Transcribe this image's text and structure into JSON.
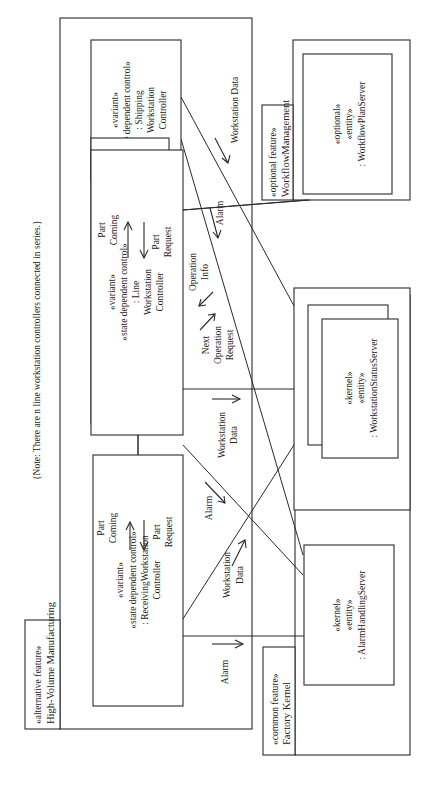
{
  "diagram": {
    "note": "{Note: There are n line workstation controllers connected in series.}",
    "packages": {
      "high_volume": {
        "stereotype": "«alternative feature»",
        "name": "High-Volume Manufacturing"
      },
      "factory_kernel": {
        "stereotype": "«common feature»",
        "name": "Factory Kernel"
      },
      "workflow_mgmt": {
        "stereotype": "«optional feature»",
        "name": "WorkflowManagement"
      }
    },
    "objects": {
      "shipping": {
        "l1": "«variant»",
        "l2": "«state dependent control»",
        "l3": ": Shipping",
        "l4": "Workstation",
        "l5": "Controller"
      },
      "line": {
        "l1": "«variant»",
        "l2": "«state dependent control»",
        "l3": ": Line",
        "l4": "Workstation",
        "l5": "Controller"
      },
      "receiving": {
        "l1": "«variant»",
        "l2": "«state dependent control»",
        "l3": ": ReceivingWorkstation",
        "l4": "Controller"
      },
      "workflow_plan_server": {
        "l1": "«optional»",
        "l2": "«entity»",
        "l3": ": WorkflowPlanServer"
      },
      "workstation_status_server": {
        "l1": "«kernel»",
        "l2": "«entity»",
        "l3": ": WorkstationStatusServer"
      },
      "alarm_handling_server": {
        "l1": "«kernel»",
        "l2": "«entity»",
        "l3": ": AlarmHandlingServer"
      }
    },
    "messages": {
      "part_coming_top": {
        "l1": "Part",
        "l2": "Coming"
      },
      "part_request_top": {
        "l1": "Part",
        "l2": "Request"
      },
      "part_coming_bottom": {
        "l1": "Part",
        "l2": "Coming"
      },
      "part_request_bottom": {
        "l1": "Part",
        "l2": "Request"
      },
      "workstation_data_shipping": "Workstation Data",
      "alarm_shipping": "Alarm",
      "operation_info": {
        "l1": "Operation",
        "l2": "Info"
      },
      "next_operation_request": {
        "l1": "Next",
        "l2": "Operation",
        "l3": "Request"
      },
      "workstation_data_line": {
        "l1": "Workstation",
        "l2": "Data"
      },
      "alarm_line": "Alarm",
      "workstation_data_receiving": {
        "l1": "Workstation",
        "l2": "Data"
      },
      "alarm_receiving": "Alarm"
    }
  }
}
